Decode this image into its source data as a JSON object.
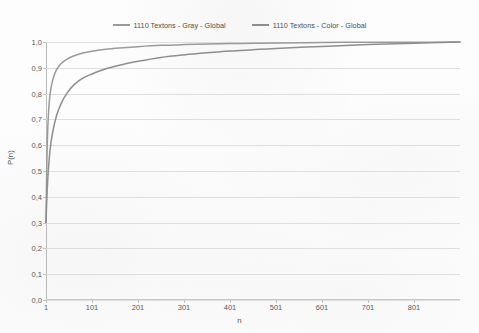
{
  "chart_data": {
    "type": "line",
    "title": "",
    "xlabel": "n",
    "ylabel": "P(n)",
    "xlim": [
      1,
      901
    ],
    "ylim": [
      0.0,
      1.0
    ],
    "grid": true,
    "legend_position": "top-center",
    "x_ticks": [
      1,
      101,
      201,
      301,
      401,
      501,
      601,
      701,
      801
    ],
    "x_tick_labels": [
      "1",
      "101",
      "201",
      "301",
      "401",
      "501",
      "601",
      "701",
      "801"
    ],
    "y_ticks": [
      0.0,
      0.1,
      0.2,
      0.3,
      0.4,
      0.5,
      0.6,
      0.7,
      0.8,
      0.9,
      1.0
    ],
    "y_tick_labels": [
      "0,0",
      "0,1",
      "0,2",
      "0,3",
      "0,4",
      "0,5",
      "0,6",
      "0,7",
      "0,8",
      "0,9",
      "1,0"
    ],
    "series": [
      {
        "name": "1110  Textons - Gray - Global",
        "color": "#9a9a9a",
        "x": [
          1,
          3,
          6,
          10,
          16,
          24,
          34,
          46,
          61,
          81,
          101,
          131,
          161,
          201,
          251,
          301,
          351,
          401,
          451,
          501,
          601,
          701,
          801,
          901
        ],
        "values": [
          0.3,
          0.55,
          0.71,
          0.8,
          0.855,
          0.893,
          0.917,
          0.933,
          0.946,
          0.957,
          0.964,
          0.972,
          0.977,
          0.982,
          0.987,
          0.99,
          0.992,
          0.994,
          0.995,
          0.996,
          0.998,
          0.999,
          0.999,
          1.0
        ]
      },
      {
        "name": "1110  Textons - Color - Global",
        "color": "#8e8e8e",
        "x": [
          1,
          3,
          6,
          10,
          16,
          24,
          34,
          46,
          61,
          81,
          101,
          131,
          161,
          201,
          251,
          301,
          351,
          401,
          451,
          501,
          601,
          701,
          801,
          901
        ],
        "values": [
          0.3,
          0.4,
          0.5,
          0.585,
          0.655,
          0.715,
          0.762,
          0.8,
          0.833,
          0.86,
          0.876,
          0.896,
          0.91,
          0.925,
          0.94,
          0.95,
          0.958,
          0.965,
          0.97,
          0.975,
          0.983,
          0.99,
          0.995,
          1.0
        ]
      }
    ]
  },
  "legend": {
    "items": [
      {
        "label": "1110  Textons - Gray - Global",
        "color": "#9a9a9a"
      },
      {
        "label": "1110  Textons - Color - Global",
        "color": "#8e8e8e"
      }
    ]
  },
  "axes": {
    "y_title": "P(n)",
    "x_title": "n"
  }
}
